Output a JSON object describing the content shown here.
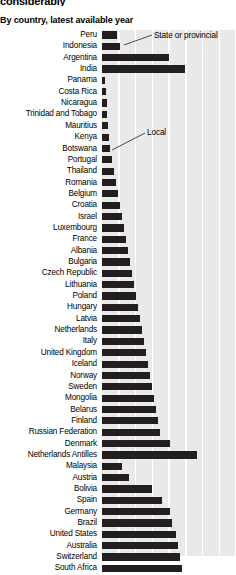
{
  "header": {
    "title": "considerably",
    "subtitle": "By country, latest available year"
  },
  "annotations": {
    "state_or_provincial": "State or provincial",
    "local": "Local"
  },
  "colors": {
    "bar": "#231f20",
    "plot_background": "#e9e9e9",
    "gridline": "#ffffff",
    "text": "#000000"
  },
  "chart_data": {
    "type": "bar",
    "orientation": "horizontal",
    "title": "considerably",
    "subtitle": "By country, latest available year",
    "xlabel": "",
    "ylabel": "",
    "xlim": [
      0,
      100
    ],
    "grid": true,
    "gridlines": [
      12.5,
      25,
      37.5,
      50,
      62.5,
      75,
      87.5,
      100
    ],
    "legend": [
      "State or provincial",
      "Local"
    ],
    "categories": [
      "Peru",
      "Indonesia",
      "Argentina",
      "India",
      "Panama",
      "Costa Rica",
      "Nicaragua",
      "Trinidad and Tobago",
      "Mauritius",
      "Kenya",
      "Botswana",
      "Portugal",
      "Thailand",
      "Romania",
      "Belgium",
      "Croatia",
      "Israel",
      "Luxembourg",
      "France",
      "Albania",
      "Bulgaria",
      "Czech Republic",
      "Lithuania",
      "Poland",
      "Hungary",
      "Latvia",
      "Netherlands",
      "Italy",
      "United Kingdom",
      "Iceland",
      "Norway",
      "Sweden",
      "Mongolia",
      "Belarus",
      "Finland",
      "Russian Federation",
      "Denmark",
      "Netherlands Antilles",
      "Malaysia",
      "Austria",
      "Bolivia",
      "Spain",
      "Germany",
      "Brazil",
      "United States",
      "Australia",
      "Switzerland",
      "South Africa"
    ],
    "values": [
      11.2,
      13.4,
      50.0,
      62.0,
      2.2,
      3.0,
      3.4,
      4.1,
      4.5,
      5.2,
      6.0,
      7.5,
      9.0,
      10.4,
      11.9,
      13.4,
      15.0,
      16.4,
      18.0,
      19.4,
      21.0,
      22.4,
      24.0,
      25.4,
      26.9,
      28.4,
      29.9,
      31.3,
      32.8,
      34.3,
      35.8,
      37.3,
      38.8,
      40.2,
      41.7,
      43.2,
      50.7,
      71.0,
      15.0,
      20.2,
      37.3,
      44.8,
      50.7,
      52.2,
      55.2,
      56.7,
      58.2,
      59.7
    ]
  }
}
